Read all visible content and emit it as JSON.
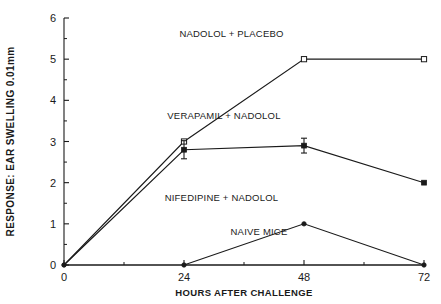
{
  "chart_data": {
    "type": "line",
    "title": "",
    "xlabel": "HOURS AFTER CHALLENGE",
    "ylabel": "RESPONSE: EAR SWELLING 0.01mm",
    "xlim": [
      0,
      72
    ],
    "ylim": [
      0,
      6
    ],
    "x_ticks": [
      0,
      24,
      48,
      72
    ],
    "x_tick_labels": [
      "0",
      "24",
      "48",
      "72"
    ],
    "x_minor_ticks": [
      12,
      36,
      60
    ],
    "y_ticks": [
      0,
      1,
      2,
      3,
      4,
      5,
      6
    ],
    "y_tick_labels": [
      "0",
      "1",
      "2",
      "3",
      "4",
      "5",
      "6"
    ],
    "y_minor_ticks": [
      0.5,
      1.5,
      2.5,
      3.5,
      4.5,
      5.5
    ],
    "grid": false,
    "legend_position": "inline-annotations",
    "series": [
      {
        "name": "NADOLOL + PLACEBO",
        "marker": "open-square",
        "x": [
          0,
          24,
          48,
          72
        ],
        "values": [
          0,
          3.0,
          5.0,
          5.0
        ],
        "errors": [
          0,
          0,
          0,
          0
        ]
      },
      {
        "name": "VERAPAMIL + NADOLOL",
        "marker": "filled-square",
        "x": [
          0,
          24,
          48,
          72
        ],
        "values": [
          0,
          2.8,
          2.9,
          2.0
        ],
        "errors": [
          0,
          0.22,
          0.18,
          0
        ]
      },
      {
        "name": "NIFEDIPINE + NADOLOL",
        "marker": "filled-circle",
        "x": [
          24,
          48,
          72
        ],
        "values": [
          0,
          1.0,
          0
        ],
        "errors": [
          0,
          0,
          0
        ]
      },
      {
        "name": "NAIVE MICE",
        "marker": "none",
        "x": [
          0,
          24,
          48,
          72
        ],
        "values": [
          0,
          0,
          0,
          0
        ],
        "errors": [
          0,
          0,
          0,
          0
        ]
      }
    ],
    "annotations": [
      {
        "text": "NADOLOL + PLACEBO",
        "x": 33.5,
        "y": 5.55
      },
      {
        "text": "VERAPAMIL + NADOLOL",
        "x": 32.0,
        "y": 3.55
      },
      {
        "text": "NIFEDIPINE + NADOLOL",
        "x": 31.5,
        "y": 1.55
      },
      {
        "text": "NAIVE MICE",
        "x": 39.0,
        "y": 0.72
      }
    ]
  }
}
